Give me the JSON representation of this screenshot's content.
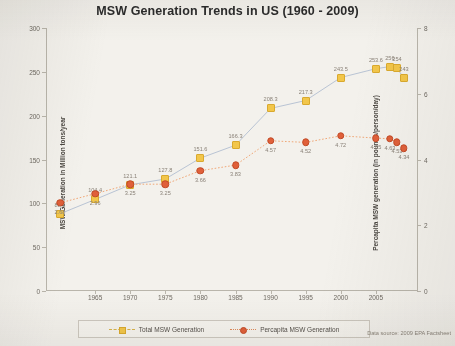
{
  "chart_data": {
    "type": "line",
    "title": "MSW Generation Trends in US (1960 - 2009)",
    "xlabel": "",
    "ylabel": "MSW Generation in Million tons/year",
    "y2label": "Percapita MSW generation (in pounds/person/day)",
    "x": [
      1960,
      1965,
      1970,
      1975,
      1980,
      1985,
      1990,
      1995,
      2000,
      2005,
      2007,
      2008,
      2009
    ],
    "xticks": [
      "1965",
      "1970",
      "1975",
      "1980",
      "1985",
      "1990",
      "1995",
      "2000",
      "2005"
    ],
    "xtick_values": [
      1965,
      1970,
      1975,
      1980,
      1985,
      1990,
      1995,
      2000,
      2005
    ],
    "yticks": [
      "0",
      "50",
      "100",
      "150",
      "200",
      "250",
      "300"
    ],
    "ytick_values": [
      0,
      50,
      100,
      150,
      200,
      250,
      300
    ],
    "ylim": [
      0,
      300
    ],
    "y2ticks": [
      "0",
      "2",
      "4",
      "6",
      "8"
    ],
    "y2tick_values": [
      0,
      2,
      4,
      6,
      8
    ],
    "y2lim": [
      0,
      8
    ],
    "xlim": [
      1958,
      2011
    ],
    "grid": false,
    "legend_position": "bottom",
    "source_note": "Data source: 2009 EPA Factsheet",
    "series": [
      {
        "name": "Total MSW Generation",
        "axis": "left",
        "color": "#f2c64a",
        "line_color": "#b9c4d4",
        "style": "solid",
        "marker": "square",
        "values": [
          88.1,
          104.4,
          121.1,
          127.8,
          151.6,
          166.3,
          208.3,
          217.3,
          243.5,
          253.6,
          256,
          254,
          243
        ],
        "labels": [
          "88.1",
          "104.4",
          "121.1",
          "127.8",
          "151.6",
          "166.3",
          "208.3",
          "217.3",
          "243.5",
          "253.6",
          "256",
          "254",
          "243"
        ]
      },
      {
        "name": "Percapita MSW Generation",
        "axis": "right",
        "color": "#e0603a",
        "line_color": "#f0a878",
        "style": "dotted",
        "marker": "circle",
        "values": [
          2.68,
          2.96,
          3.25,
          3.25,
          3.66,
          3.83,
          4.57,
          4.52,
          4.72,
          4.65,
          4.63,
          4.53,
          4.34
        ],
        "labels": [
          "2.68",
          "2.96",
          "3.25",
          "3.25",
          "3.66",
          "3.83",
          "4.57",
          "4.52",
          "4.72",
          "4.65",
          "4.63",
          "4.53",
          "4.34"
        ]
      }
    ]
  }
}
